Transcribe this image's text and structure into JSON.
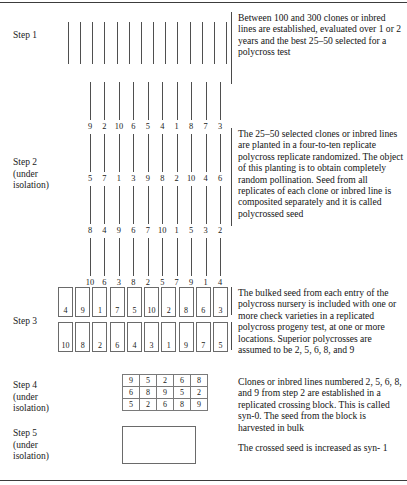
{
  "diagram": {
    "steps": [
      {
        "id": "step1",
        "label": "Step 1"
      },
      {
        "id": "step2",
        "label": "Step 2\n(under\nisolation)"
      },
      {
        "id": "step3",
        "label": "Step 3"
      },
      {
        "id": "step4",
        "label": "Step 4\n(under\nisolation)"
      },
      {
        "id": "step5",
        "label": "Step 5\n(under\nisolation)"
      }
    ],
    "descriptions": [
      {
        "id": "desc1",
        "text": "Between 100 and 300 clones or inbred lines are established, evaluated over 1 or 2 years and the best 25–50 selected for a polycross test"
      },
      {
        "id": "desc2",
        "text": "The 25–50 selected clones or inbred lines are planted in a four-to-ten replicate polycross replicate randomized. The object of this planting is to obtain completely random pollination. Seed from all replicates of each clone or inbred line is composited separately and it is called polycrossed seed"
      },
      {
        "id": "desc3",
        "text": "The bulked seed from each entry of the polycross nursery is included with one or more check varieties in a replicated polycross progeny test, at one or more locations. Superior polycrosses are assumed to be 2, 5, 6, 8, and 9"
      },
      {
        "id": "desc4",
        "text": "Clones or inbred lines numbered 2, 5, 6, 8, and 9 from step 2 are established in a replicated crossing block. This is called syn-0. The seed from the block is harvested in bulk"
      },
      {
        "id": "desc5",
        "text": "The crossed seed is increased as syn- 1"
      }
    ],
    "step1": {
      "tick_count": 14
    },
    "step2": {
      "replicate_rows": [
        {
          "row": 1,
          "numbers": [
            "9",
            "2",
            "10",
            "6",
            "5",
            "4",
            "1",
            "8",
            "7",
            "3"
          ]
        },
        {
          "row": 2,
          "numbers": [
            "5",
            "7",
            "1",
            "3",
            "9",
            "8",
            "2",
            "10",
            "4",
            "6"
          ]
        },
        {
          "row": 3,
          "numbers": [
            "8",
            "4",
            "9",
            "6",
            "7",
            "10",
            "1",
            "5",
            "3",
            "2"
          ]
        },
        {
          "row": 4,
          "numbers": [
            "10",
            "6",
            "3",
            "8",
            "2",
            "5",
            "7",
            "9",
            "1",
            "4"
          ]
        }
      ]
    },
    "step3": {
      "box_rows": [
        {
          "row": 1,
          "numbers": [
            "4",
            "9",
            "1",
            "7",
            "5",
            "10",
            "2",
            "8",
            "6",
            "3"
          ]
        },
        {
          "row": 2,
          "numbers": [
            "10",
            "8",
            "2",
            "6",
            "4",
            "3",
            "1",
            "9",
            "7",
            "5"
          ]
        }
      ]
    },
    "step4": {
      "grid_rows": [
        [
          "9",
          "5",
          "2",
          "6",
          "8"
        ],
        [
          "6",
          "8",
          "9",
          "5",
          "2"
        ],
        [
          "5",
          "2",
          "6",
          "8",
          "9"
        ]
      ]
    },
    "step5": {
      "block_label": ""
    },
    "colors": {
      "ink": "#1a1a1a",
      "rule": "#4f4f4f",
      "box_border": "#6a6a6a",
      "background": "#ffffff"
    }
  }
}
